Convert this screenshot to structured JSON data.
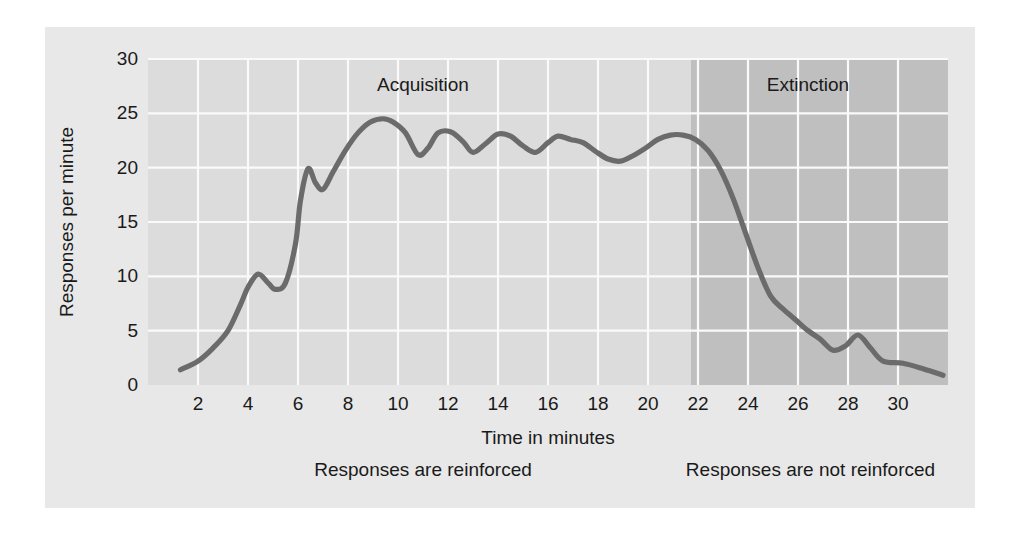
{
  "chart_data": {
    "type": "line",
    "title": "",
    "xlabel": "Time in minutes",
    "ylabel": "Responses per minute",
    "xlim": [
      0,
      32
    ],
    "ylim": [
      0,
      30
    ],
    "xticks": [
      2,
      4,
      6,
      8,
      10,
      12,
      14,
      16,
      18,
      20,
      22,
      24,
      26,
      28,
      30
    ],
    "yticks": [
      0,
      5,
      10,
      15,
      20,
      25,
      30
    ],
    "grid": true,
    "legend": "none",
    "series": [
      {
        "name": "Responses per minute",
        "color": "#6b6b6b",
        "x": [
          1.3,
          2.0,
          2.6,
          3.2,
          3.7,
          4.0,
          4.4,
          4.8,
          5.1,
          5.5,
          5.9,
          6.1,
          6.4,
          6.7,
          7.0,
          7.4,
          7.9,
          8.4,
          8.9,
          9.4,
          9.8,
          10.3,
          10.8,
          11.2,
          11.6,
          12.1,
          12.6,
          13.0,
          13.5,
          14.0,
          14.5,
          15.0,
          15.5,
          16.0,
          16.4,
          16.9,
          17.4,
          17.9,
          18.4,
          18.9,
          19.4,
          19.9,
          20.4,
          20.9,
          21.4,
          21.9,
          22.4,
          22.9,
          23.4,
          23.9,
          24.4,
          24.9,
          25.4,
          25.9,
          26.4,
          26.9,
          27.4,
          27.9,
          28.4,
          28.9,
          29.4,
          30.2,
          31.0,
          31.8
        ],
        "y": [
          1.4,
          2.2,
          3.4,
          5.0,
          7.4,
          9.0,
          10.2,
          9.4,
          8.8,
          9.4,
          13.0,
          17.0,
          19.9,
          18.6,
          18.0,
          19.6,
          21.6,
          23.2,
          24.2,
          24.5,
          24.2,
          23.2,
          21.2,
          21.8,
          23.2,
          23.3,
          22.4,
          21.4,
          22.2,
          23.1,
          22.9,
          22.0,
          21.4,
          22.3,
          22.9,
          22.6,
          22.3,
          21.5,
          20.8,
          20.6,
          21.1,
          21.8,
          22.6,
          23.0,
          23.0,
          22.6,
          21.6,
          19.8,
          17.2,
          14.0,
          10.8,
          8.2,
          7.0,
          6.0,
          5.0,
          4.2,
          3.2,
          3.6,
          4.6,
          3.4,
          2.2,
          2.0,
          1.5,
          0.9
        ]
      }
    ],
    "annotations": [
      {
        "text": "Acquisition",
        "x": 11.0,
        "y": 27.6
      },
      {
        "text": "Extinction",
        "x": 26.4,
        "y": 27.6
      }
    ],
    "shaded_regions": [
      {
        "label": "acquisition-region",
        "x_start": 0,
        "x_end": 21.7,
        "color": "#dcdcdc"
      },
      {
        "label": "extinction-region",
        "x_start": 21.7,
        "x_end": 32,
        "color": "#bfbfbf"
      }
    ],
    "footnotes": [
      {
        "text": "Responses are reinforced",
        "x_center": 11.0
      },
      {
        "text": "Responses are not reinforced",
        "x_center": 26.5
      }
    ]
  },
  "figure": {
    "background": "#e8e8e8",
    "page_background": "#ffffff",
    "plot_background": "#dcdcdc",
    "extinction_background": "#bfbfbf",
    "gridline_color": "#fafafa",
    "line_color": "#6b6b6b",
    "text_color": "#1a1a1a"
  }
}
